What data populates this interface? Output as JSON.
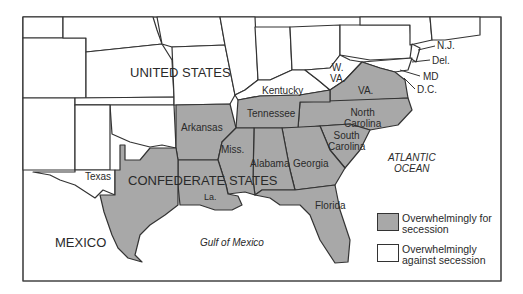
{
  "colors": {
    "for_secession": "#a8a8a8",
    "against_secession": "#ffffff",
    "border": "#333333",
    "frame": "#444444"
  },
  "labels": {
    "united_states": "UNITED STATES",
    "confederate_states": "CONFEDERATE STATES",
    "mexico": "MEXICO",
    "gulf": "Gulf of Mexico",
    "atlantic_line1": "ATLANTIC",
    "atlantic_line2": "OCEAN",
    "states": {
      "texas": "Texas",
      "arkansas": "Arkansas",
      "louisiana": "La.",
      "mississippi": "Miss.",
      "alabama": "Alabama",
      "georgia": "Georgia",
      "florida": "Florida",
      "tennessee": "Tennessee",
      "kentucky": "Kentucky",
      "south_carolina_1": "South",
      "south_carolina_2": "Carolina",
      "north_carolina_1": "North",
      "north_carolina_2": "Carolina",
      "virginia": "VA.",
      "west_virginia_1": "W.",
      "west_virginia_2": "VA.",
      "new_jersey": "N.J.",
      "delaware": "Del.",
      "maryland": "MD",
      "dc": "D.C."
    }
  },
  "legend": [
    {
      "label_1": "Overwhelmingly for",
      "label_2": "secession",
      "color": "#a8a8a8"
    },
    {
      "label_1": "Overwhelmingly",
      "label_2": "against secession",
      "color": "#ffffff"
    }
  ]
}
